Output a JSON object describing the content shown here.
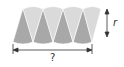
{
  "diagram": {
    "sectors": {
      "count": 8,
      "colors": {
        "light": "#d9d9d9",
        "dark": "#a6a6a6",
        "edge": "#ffffff"
      }
    },
    "labels": {
      "height": "r",
      "width": "?"
    }
  }
}
